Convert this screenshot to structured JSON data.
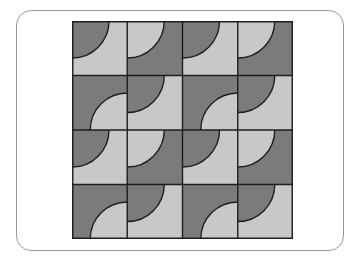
{
  "figure": {
    "colors": {
      "dark": "#7b7b7b",
      "light": "#c8c8c8",
      "line": "#1e1e1e",
      "frame": "#9a9a9a"
    },
    "grid": {
      "rows": 4,
      "cols": 4,
      "arc_radius_ratio": 0.67
    },
    "tiles": [
      [
        {
          "corner": "tl",
          "disc": "dark",
          "bg": "light"
        },
        {
          "corner": "tl",
          "disc": "light",
          "bg": "dark"
        },
        {
          "corner": "tl",
          "disc": "dark",
          "bg": "light"
        },
        {
          "corner": "tl",
          "disc": "light",
          "bg": "dark"
        }
      ],
      [
        {
          "corner": "br",
          "disc": "light",
          "bg": "dark"
        },
        {
          "corner": "tl",
          "disc": "dark",
          "bg": "light"
        },
        {
          "corner": "br",
          "disc": "light",
          "bg": "dark"
        },
        {
          "corner": "tl",
          "disc": "dark",
          "bg": "light"
        }
      ],
      [
        {
          "corner": "tl",
          "disc": "dark",
          "bg": "light"
        },
        {
          "corner": "tl",
          "disc": "light",
          "bg": "dark"
        },
        {
          "corner": "tl",
          "disc": "dark",
          "bg": "light"
        },
        {
          "corner": "tl",
          "disc": "light",
          "bg": "dark"
        }
      ],
      [
        {
          "corner": "br",
          "disc": "light",
          "bg": "dark"
        },
        {
          "corner": "tl",
          "disc": "dark",
          "bg": "light"
        },
        {
          "corner": "br",
          "disc": "light",
          "bg": "dark"
        },
        {
          "corner": "tl",
          "disc": "dark",
          "bg": "light"
        }
      ]
    ]
  }
}
